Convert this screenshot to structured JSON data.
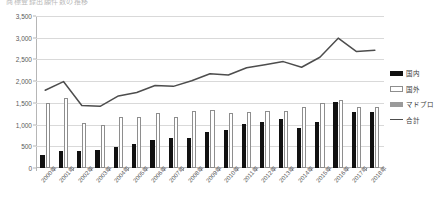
{
  "title_sliver": "商標登録出願件数の推移",
  "legend": {
    "position": "right",
    "items": [
      {
        "label": "国内",
        "key": "domestic",
        "color": "#111111",
        "marker": "filled-bar"
      },
      {
        "label": "国外",
        "key": "foreign",
        "color": "#ffffff",
        "marker": "hollow-bar"
      },
      {
        "label": "マドプロ",
        "key": "madpro",
        "color": "#9a9a9a",
        "marker": "gray-bar"
      },
      {
        "label": "合計",
        "key": "total",
        "color": "#4d4d4d",
        "marker": "line"
      }
    ]
  },
  "chart_data": {
    "type": "bar",
    "title": "商標登録出願件数の推移",
    "xlabel": "",
    "ylabel": "",
    "ylim": [
      0,
      3500
    ],
    "ytick_step": 500,
    "grid": true,
    "yticks": [
      "0",
      "500",
      "1,000",
      "1,500",
      "2,000",
      "2,500",
      "3,000",
      "3,500"
    ],
    "ytick_values": [
      0,
      500,
      1000,
      1500,
      2000,
      2500,
      3000,
      3500
    ],
    "categories": [
      "2000年",
      "2001年",
      "2002年",
      "2003年",
      "2004年",
      "2005年",
      "2006年",
      "2007年",
      "2008年",
      "2009年",
      "2010年",
      "2011年",
      "2012年",
      "2013年",
      "2014年",
      "2015年",
      "2016年",
      "2017年",
      "2018年"
    ],
    "series": [
      {
        "name": "国内",
        "type": "bar",
        "color": "#111111",
        "values": [
          300,
          390,
          400,
          420,
          480,
          560,
          640,
          700,
          700,
          840,
          880,
          1010,
          1070,
          1130,
          920,
          1050,
          1510,
          1280,
          1300
        ]
      },
      {
        "name": "国外",
        "type": "bar",
        "color": "#ffffff",
        "values": [
          1490,
          1610,
          1040,
          1000,
          1180,
          1180,
          1260,
          1180,
          1310,
          1330,
          1260,
          1300,
          1310,
          1320,
          1400,
          1500,
          1560,
          1400,
          1410
        ]
      },
      {
        "name": "マドプロ",
        "type": "bar",
        "color": "#9a9a9a",
        "values": [
          0,
          0,
          0,
          0,
          0,
          0,
          0,
          0,
          0,
          0,
          0,
          0,
          0,
          0,
          0,
          0,
          0,
          0,
          0
        ]
      },
      {
        "name": "合計",
        "type": "line",
        "color": "#4d4d4d",
        "values": [
          1790,
          1990,
          1440,
          1420,
          1660,
          1740,
          1900,
          1880,
          2010,
          2170,
          2140,
          2310,
          2380,
          2450,
          2320,
          2550,
          2990,
          2680,
          2710
        ]
      }
    ]
  }
}
